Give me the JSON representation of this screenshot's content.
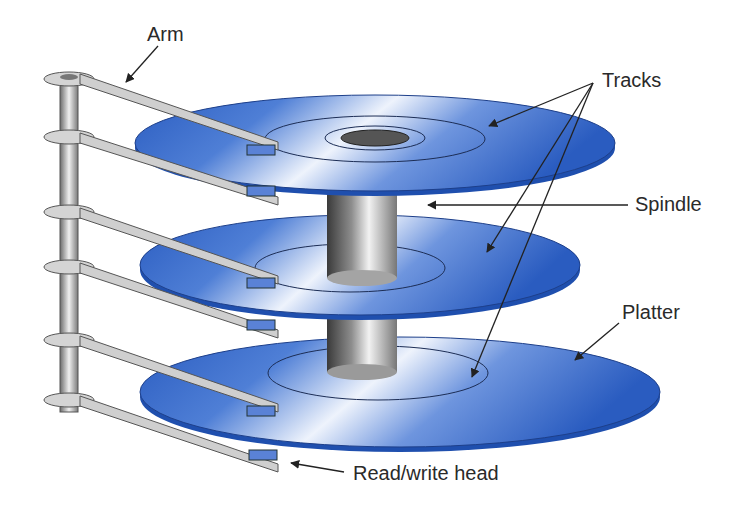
{
  "diagram": {
    "labels": {
      "arm": "Arm",
      "tracks": "Tracks",
      "spindle": "Spindle",
      "platter": "Platter",
      "read_write_head": "Read/write head"
    },
    "components": {
      "platters": 3,
      "arms": 6,
      "read_write_heads": 6
    },
    "colors": {
      "platter_blue": "#2f62c4",
      "platter_highlight": "#e6eefb",
      "spindle_gray": "#8a8a8a",
      "arm_gray": "#cfcfcf",
      "head_blue": "#5a82d6",
      "text": "#2a2a2a"
    }
  }
}
